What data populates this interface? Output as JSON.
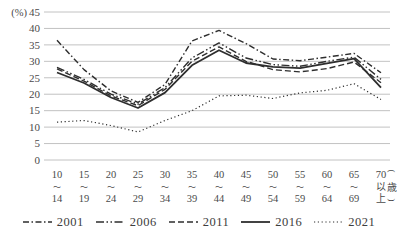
{
  "chart_data": {
    "type": "line",
    "title": "",
    "y_axis": {
      "unit_label": "(%)",
      "min": 0,
      "max": 45,
      "step": 5,
      "tick_labels": [
        "45",
        "40",
        "35",
        "30",
        "25",
        "20",
        "15",
        "10",
        "5",
        "0"
      ]
    },
    "x_axis": {
      "unit_label_chars": [
        "(",
        "歳",
        ")"
      ],
      "tick_labels": [
        {
          "top": "10",
          "mid": "〜",
          "bottom": "14"
        },
        {
          "top": "15",
          "mid": "〜",
          "bottom": "19"
        },
        {
          "top": "20",
          "mid": "〜",
          "bottom": "24"
        },
        {
          "top": "25",
          "mid": "〜",
          "bottom": "29"
        },
        {
          "top": "30",
          "mid": "〜",
          "bottom": "34"
        },
        {
          "top": "35",
          "mid": "〜",
          "bottom": "39"
        },
        {
          "top": "40",
          "mid": "〜",
          "bottom": "44"
        },
        {
          "top": "45",
          "mid": "〜",
          "bottom": "49"
        },
        {
          "top": "50",
          "mid": "〜",
          "bottom": "54"
        },
        {
          "top": "55",
          "mid": "〜",
          "bottom": "59"
        },
        {
          "top": "60",
          "mid": "〜",
          "bottom": "64"
        },
        {
          "top": "65",
          "mid": "〜",
          "bottom": "69"
        },
        {
          "top": "70",
          "mid": "以",
          "bottom": "上"
        }
      ]
    },
    "categories": [
      "10〜14",
      "15〜19",
      "20〜24",
      "25〜29",
      "30〜34",
      "35〜39",
      "40〜44",
      "45〜49",
      "50〜54",
      "55〜59",
      "60〜64",
      "65〜69",
      "70以上"
    ],
    "series": [
      {
        "name": "2001",
        "style": "dashdot",
        "values": [
          36.4,
          27.5,
          21.0,
          17.5,
          23.0,
          36.2,
          39.4,
          35.4,
          30.7,
          30.2,
          31.3,
          32.4,
          26.5
        ]
      },
      {
        "name": "2006",
        "style": "dash-dot-dot",
        "values": [
          28.2,
          24.5,
          20.0,
          17.0,
          22.0,
          31.0,
          35.6,
          31.0,
          29.0,
          28.5,
          30.0,
          31.3,
          24.5
        ]
      },
      {
        "name": "2011",
        "style": "dashed",
        "values": [
          27.7,
          24.0,
          19.5,
          16.5,
          21.5,
          30.0,
          34.4,
          30.0,
          27.5,
          26.8,
          27.8,
          29.8,
          23.5
        ]
      },
      {
        "name": "2016",
        "style": "solid",
        "values": [
          26.6,
          23.4,
          19.0,
          15.8,
          20.5,
          28.8,
          33.4,
          29.5,
          28.3,
          27.9,
          29.4,
          30.8,
          22.0
        ]
      },
      {
        "name": "2021",
        "style": "dotted",
        "values": [
          11.5,
          12.0,
          10.5,
          8.5,
          12.0,
          15.0,
          19.5,
          19.7,
          18.7,
          20.4,
          21.2,
          23.2,
          18.4
        ]
      }
    ],
    "legend": {
      "position": "bottom",
      "labels": [
        "2001",
        "2006",
        "2011",
        "2016",
        "2021"
      ]
    },
    "grid": "horizontal",
    "colors": {
      "line": "#2e2e2e",
      "grid": "#b3b3b3",
      "label": "#4a4a4a"
    }
  }
}
